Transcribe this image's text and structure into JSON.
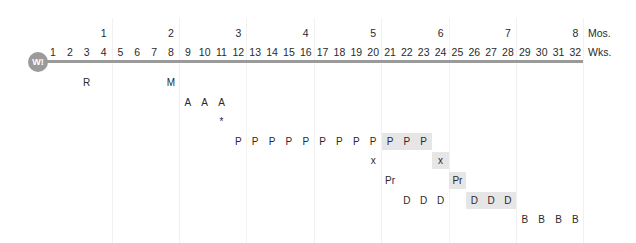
{
  "axis": {
    "months_label": "Mos.",
    "weeks_label": "Wks.",
    "months": [
      {
        "label": "1",
        "week": 4
      },
      {
        "label": "2",
        "week": 8
      },
      {
        "label": "3",
        "week": 12
      },
      {
        "label": "4",
        "week": 16
      },
      {
        "label": "5",
        "week": 20
      },
      {
        "label": "6",
        "week": 24
      },
      {
        "label": "7",
        "week": 28
      },
      {
        "label": "8",
        "week": 32
      }
    ],
    "weeks": [
      "1",
      "2",
      "3",
      "4",
      "5",
      "6",
      "7",
      "8",
      "9",
      "10",
      "11",
      "12",
      "13",
      "14",
      "15",
      "16",
      "17",
      "18",
      "19",
      "20",
      "21",
      "22",
      "23",
      "24",
      "25",
      "26",
      "27",
      "28",
      "29",
      "30",
      "31",
      "32"
    ]
  },
  "badge": {
    "label": "W!"
  },
  "colors": {
    "timeline": "#9a9a9a",
    "shade": "#e6e6e6",
    "text": "#2a2a2a"
  },
  "rows": [
    {
      "name": "row-r-m",
      "cells": [
        {
          "week": 3,
          "label": "R",
          "shaded": false
        },
        {
          "week": 8,
          "label": "M",
          "shaded": false
        }
      ]
    },
    {
      "name": "row-a",
      "cells": [
        {
          "week": 9,
          "label": "A",
          "shaded": false
        },
        {
          "week": 10,
          "label": "A",
          "shaded": false
        },
        {
          "week": 11,
          "label": "A",
          "shaded": false
        }
      ]
    },
    {
      "name": "row-asterisk",
      "cells": [
        {
          "week": 11,
          "label": "*",
          "shaded": false
        }
      ]
    },
    {
      "name": "row-p",
      "cells": [
        {
          "week": 12,
          "label": "P",
          "shaded": false
        },
        {
          "week": 13,
          "label": "P",
          "shaded": false
        },
        {
          "week": 14,
          "label": "P",
          "shaded": false
        },
        {
          "week": 15,
          "label": "P",
          "shaded": false
        },
        {
          "week": 16,
          "label": "P",
          "shaded": false
        },
        {
          "week": 17,
          "label": "P",
          "shaded": false
        },
        {
          "week": 18,
          "label": "P",
          "shaded": false
        },
        {
          "week": 19,
          "label": "P",
          "shaded": false
        },
        {
          "week": 20,
          "label": "P",
          "shaded": false
        },
        {
          "week": 21,
          "label": "P",
          "shaded": true
        },
        {
          "week": 22,
          "label": "P",
          "shaded": true
        },
        {
          "week": 23,
          "label": "P",
          "shaded": true
        }
      ]
    },
    {
      "name": "row-x",
      "cells": [
        {
          "week": 20,
          "label": "x",
          "shaded": false
        },
        {
          "week": 24,
          "label": "x",
          "shaded": true
        }
      ]
    },
    {
      "name": "row-pr",
      "cells": [
        {
          "week": 21,
          "label": "Pr",
          "shaded": false
        },
        {
          "week": 25,
          "label": "Pr",
          "shaded": true
        }
      ]
    },
    {
      "name": "row-d",
      "cells": [
        {
          "week": 22,
          "label": "D",
          "shaded": false
        },
        {
          "week": 23,
          "label": "D",
          "shaded": false
        },
        {
          "week": 24,
          "label": "D",
          "shaded": false
        },
        {
          "week": 26,
          "label": "D",
          "shaded": true
        },
        {
          "week": 27,
          "label": "D",
          "shaded": true
        },
        {
          "week": 28,
          "label": "D",
          "shaded": true
        }
      ]
    },
    {
      "name": "row-b",
      "cells": [
        {
          "week": 29,
          "label": "B",
          "shaded": false
        },
        {
          "week": 30,
          "label": "B",
          "shaded": false
        },
        {
          "week": 31,
          "label": "B",
          "shaded": false
        },
        {
          "week": 32,
          "label": "B",
          "shaded": false
        }
      ]
    }
  ]
}
